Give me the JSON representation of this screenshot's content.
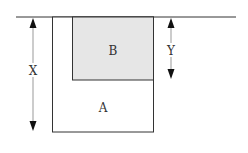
{
  "diagram": {
    "labels": {
      "region_a": "A",
      "region_b": "B",
      "dimension_x": "X",
      "dimension_y": "Y"
    },
    "colors": {
      "line": "#333333",
      "region_b_fill": "#e6e6e6",
      "background": "#ffffff"
    }
  }
}
